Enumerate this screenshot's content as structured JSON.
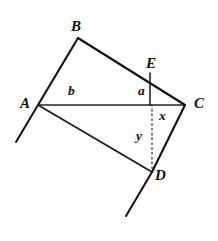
{
  "figure": {
    "background_color": "#ffffff",
    "stroke_color": "#14100e",
    "width": 218,
    "height": 241,
    "points": {
      "A": {
        "label": "A",
        "x": 38,
        "y": 105
      },
      "B": {
        "label": "B",
        "x": 78,
        "y": 38
      },
      "C": {
        "label": "C",
        "x": 185,
        "y": 105
      },
      "D": {
        "label": "D",
        "x": 152,
        "y": 172
      },
      "E": {
        "label": "E",
        "x": 150,
        "y": 73
      }
    },
    "vertex_labels": [
      {
        "name": "A",
        "text": "A",
        "left": 20,
        "top": 96
      },
      {
        "name": "B",
        "text": "B",
        "left": 71,
        "top": 19
      },
      {
        "name": "C",
        "text": "C",
        "left": 194,
        "top": 96
      },
      {
        "name": "D",
        "text": "D",
        "left": 155,
        "top": 168
      },
      {
        "name": "E",
        "text": "E",
        "left": 146,
        "top": 56
      }
    ],
    "segment_labels": [
      {
        "name": "b",
        "text": "b",
        "left": 68,
        "top": 84
      },
      {
        "name": "a",
        "text": "a",
        "left": 138,
        "top": 84
      },
      {
        "name": "x",
        "text": "x",
        "left": 159,
        "top": 109
      },
      {
        "name": "y",
        "text": "y",
        "left": 136,
        "top": 129
      }
    ],
    "edges": [
      {
        "name": "edge-ab",
        "from": "A",
        "to": "B"
      },
      {
        "name": "edge-bc",
        "from": "B",
        "to": "C"
      },
      {
        "name": "edge-cd",
        "from": "C",
        "to": "D"
      },
      {
        "name": "edge-da",
        "from": "D",
        "to": "A"
      }
    ],
    "diagonal": {
      "name": "diagonal-ac",
      "from": "A",
      "to": "C",
      "label": "b"
    },
    "altitude_a": {
      "name": "segment-a",
      "from": "E",
      "to_x": 150,
      "to_y": 105,
      "label": "a"
    },
    "altitude_y": {
      "name": "segment-y",
      "from_x": 152,
      "from_y": 105,
      "to": "D",
      "label": "y",
      "style": "dashed"
    },
    "segment_x": {
      "name": "segment-x",
      "from_x": 152,
      "from_y": 105,
      "to_x": 185,
      "to_y": 105,
      "label": "x"
    },
    "rays": [
      {
        "name": "ray-ba-extended",
        "x1": 38,
        "y1": 105,
        "x2": 16,
        "y2": 142
      },
      {
        "name": "ray-cd-extended",
        "x1": 152,
        "y1": 172,
        "x2": 126,
        "y2": 216
      }
    ]
  }
}
